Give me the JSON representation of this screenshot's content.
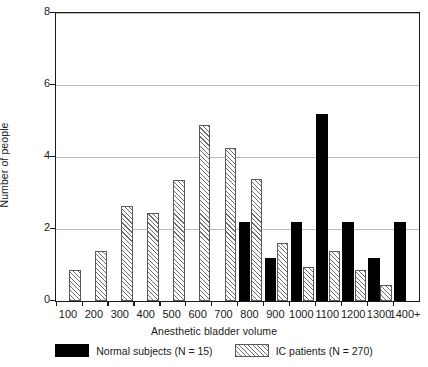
{
  "chart_data": {
    "type": "bar",
    "title": "",
    "xlabel": "Anesthetic bladder volume",
    "ylabel": "Number of people",
    "categories": [
      "100",
      "200",
      "300",
      "400",
      "500",
      "600",
      "700",
      "800",
      "900",
      "1000",
      "1100",
      "1200",
      "1300",
      "1400+"
    ],
    "series": [
      {
        "name": "Normal subjects (N = 15)",
        "fill": "solid-black",
        "color": "#000000",
        "values": [
          0,
          0,
          0,
          0,
          0,
          0,
          0,
          2.2,
          1.2,
          2.2,
          5.2,
          2.2,
          1.2,
          2.2
        ]
      },
      {
        "name": "IC patients (N = 270)",
        "fill": "hatched",
        "color": "#6e6e6e",
        "values": [
          0.85,
          1.4,
          2.65,
          2.45,
          3.35,
          4.9,
          4.25,
          3.4,
          1.6,
          0.95,
          1.4,
          0.85,
          0.45,
          0
        ]
      }
    ],
    "ylim": [
      0,
      8
    ],
    "y_ticks": [
      0,
      2,
      4,
      6,
      8
    ],
    "grid": "horizontal",
    "legend_position": "bottom-center"
  },
  "axes": {
    "y_title": "Number of people",
    "x_title": "Anesthetic bladder volume",
    "y_tick_labels": [
      "0",
      "2",
      "4",
      "6",
      "8"
    ],
    "x_tick_labels": [
      "100",
      "200",
      "300",
      "400",
      "500",
      "600",
      "700",
      "800",
      "900",
      "1000",
      "1100",
      "1200",
      "1300",
      "1400+"
    ]
  },
  "legend": {
    "entries": [
      {
        "label": "Normal subjects (N = 15)",
        "swatch": "solid-black-swatch"
      },
      {
        "label": "IC patients (N = 270)",
        "swatch": "hatched-swatch"
      }
    ]
  }
}
